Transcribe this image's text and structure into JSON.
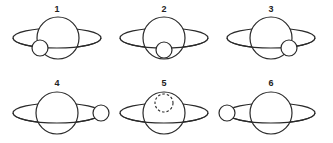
{
  "diagram": {
    "panels": [
      {
        "label": "1",
        "moon_position": "front-left-lower",
        "moon_style": "solid"
      },
      {
        "label": "2",
        "moon_position": "front-center-lower",
        "moon_style": "solid"
      },
      {
        "label": "3",
        "moon_position": "front-right-lower",
        "moon_style": "solid"
      },
      {
        "label": "4",
        "moon_position": "right-outside",
        "moon_style": "solid"
      },
      {
        "label": "5",
        "moon_position": "behind-top",
        "moon_style": "dashed"
      },
      {
        "label": "6",
        "moon_position": "left-outside",
        "moon_style": "solid"
      }
    ],
    "colors": {
      "line": "#2a2a2a",
      "background": "#ffffff"
    }
  }
}
